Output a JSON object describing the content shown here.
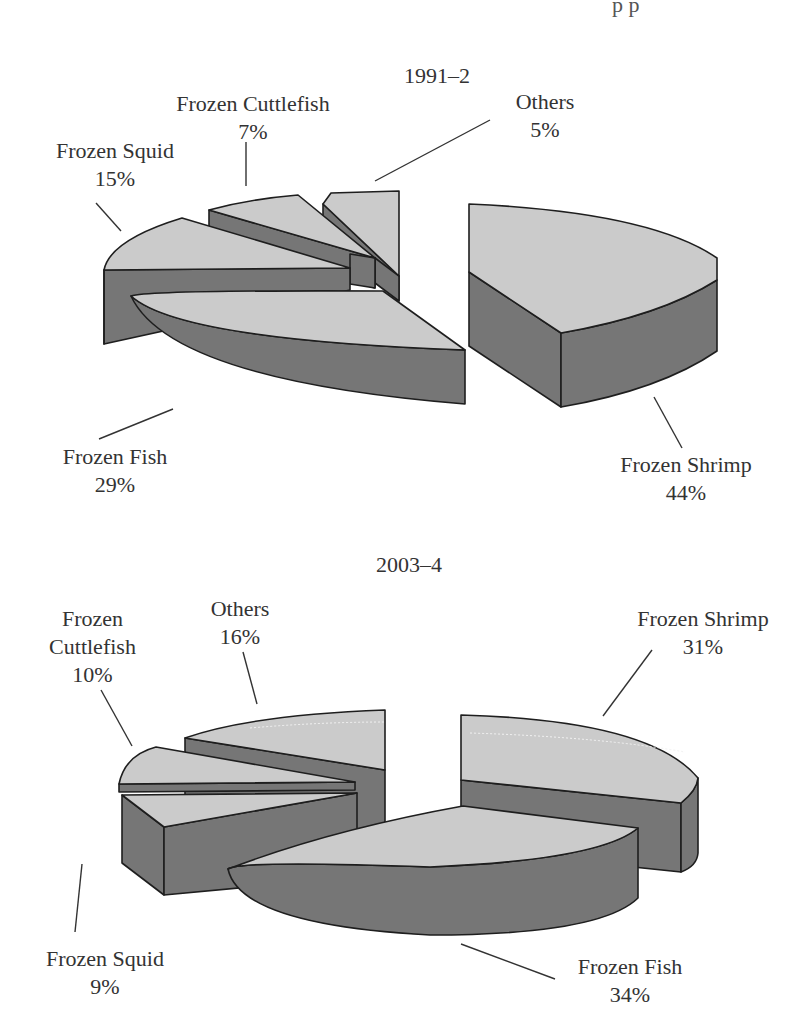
{
  "header_clip": "p p",
  "chart_data": [
    {
      "type": "pie",
      "style": "3d-exploded",
      "title": "1991–2",
      "slices": [
        {
          "key": "shrimp",
          "label": "Frozen Shrimp",
          "value": 44,
          "display": "44%"
        },
        {
          "key": "fish",
          "label": "Frozen Fish",
          "value": 29,
          "display": "29%"
        },
        {
          "key": "squid",
          "label": "Frozen Squid",
          "value": 15,
          "display": "15%"
        },
        {
          "key": "cuttlefish",
          "label": "Frozen Cuttlefish",
          "value": 7,
          "display": "7%"
        },
        {
          "key": "others",
          "label": "Others",
          "value": 5,
          "display": "5%"
        }
      ],
      "unit": "%",
      "colors": {
        "top": "#cbcbcb",
        "side": "#767676",
        "outline": "#1e1e1e"
      }
    },
    {
      "type": "pie",
      "style": "3d-exploded",
      "title": "2003–4",
      "slices": [
        {
          "key": "shrimp",
          "label": "Frozen Shrimp",
          "value": 31,
          "display": "31%"
        },
        {
          "key": "fish",
          "label": "Frozen Fish",
          "value": 34,
          "display": "34%"
        },
        {
          "key": "squid",
          "label": "Frozen Squid",
          "value": 9,
          "display": "9%"
        },
        {
          "key": "cuttlefish",
          "label_lines": [
            "Frozen",
            "Cuttlefish"
          ],
          "label": "Frozen Cuttlefish",
          "value": 10,
          "display": "10%"
        },
        {
          "key": "others",
          "label": "Others",
          "value": 16,
          "display": "16%"
        }
      ],
      "unit": "%",
      "colors": {
        "top": "#cbcbcb",
        "side": "#767676",
        "outline": "#1e1e1e"
      }
    }
  ]
}
